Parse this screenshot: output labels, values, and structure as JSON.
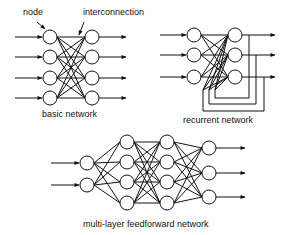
{
  "diagrams": {
    "basic": {
      "caption": "basic network",
      "annotations": {
        "node": "node",
        "interconnection": "interconnection"
      },
      "layers": [
        4,
        4
      ],
      "inputs": 4,
      "outputs": 4
    },
    "recurrent": {
      "caption": "recurrent network",
      "layers": [
        3,
        3
      ],
      "inputs": 3,
      "outputs": 3,
      "feedback_loops": 3
    },
    "multilayer": {
      "caption": "multi-layer feedforward network",
      "layers": [
        2,
        4,
        4,
        3
      ],
      "inputs": 2,
      "outputs": 3
    }
  },
  "colors": {
    "stroke": "#111111",
    "background": "#ffffff"
  }
}
